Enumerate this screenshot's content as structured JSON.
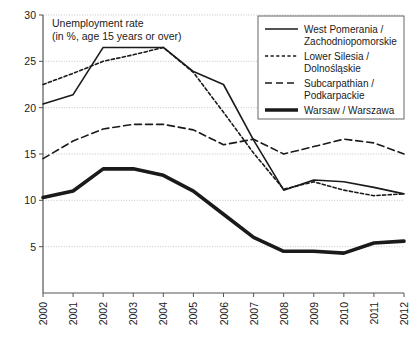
{
  "chart_data": {
    "type": "line",
    "title": "Unemployment rate",
    "subtitle": "(in %, age 15 years or over)",
    "xlabel": "",
    "ylabel": "",
    "x": [
      "2000",
      "2001",
      "2002",
      "2003",
      "2004",
      "2005",
      "2006",
      "2007",
      "2008",
      "2009",
      "2010",
      "2011",
      "2012"
    ],
    "categories": [
      "2000",
      "2001",
      "2002",
      "2003",
      "2004",
      "2005",
      "2006",
      "2007",
      "2008",
      "2009",
      "2010",
      "2011",
      "2012"
    ],
    "ylim": [
      0,
      30
    ],
    "yticks": [
      5,
      10,
      15,
      20,
      25,
      30
    ],
    "grid": true,
    "legend_position": "top-right",
    "series": [
      {
        "name": "West Pomerania / Zachodniopomorskie",
        "style": "solid-thin",
        "values": [
          20.4,
          21.4,
          26.5,
          26.5,
          26.5,
          23.9,
          22.5,
          16.5,
          11.1,
          12.2,
          12.0,
          11.4,
          10.7
        ]
      },
      {
        "name": "Lower Silesia / Dolnośląskie",
        "style": "dotted",
        "values": [
          22.5,
          23.7,
          25.0,
          25.7,
          26.5,
          23.8,
          19.5,
          15.1,
          11.2,
          12.0,
          11.1,
          10.5,
          10.7
        ]
      },
      {
        "name": "Subcarpathian / Podkarpackie",
        "style": "dashed",
        "values": [
          14.5,
          16.4,
          17.7,
          18.2,
          18.2,
          17.6,
          16.0,
          16.6,
          15.0,
          15.8,
          16.6,
          16.2,
          15.0
        ]
      },
      {
        "name": "Warsaw / Warszawa",
        "style": "solid-thick",
        "values": [
          10.3,
          11.0,
          13.4,
          13.4,
          12.7,
          11.0,
          8.5,
          6.0,
          4.5,
          4.5,
          4.3,
          5.4,
          5.6
        ]
      }
    ]
  },
  "legend": {
    "items": [
      {
        "label_line1": "West Pomerania /",
        "label_line2": "Zachodniopomorskie",
        "style": "solid-thin"
      },
      {
        "label_line1": "Lower Silesia /",
        "label_line2": "Dolnośląskie",
        "style": "dotted"
      },
      {
        "label_line1": "Subcarpathian /",
        "label_line2": "Podkarpackie",
        "style": "dashed"
      },
      {
        "label_line1": "Warsaw / Warszawa",
        "label_line2": "",
        "style": "solid-thick"
      }
    ]
  },
  "colors": {
    "line": "#1a1a1a",
    "grid": "#b8b8b8",
    "axis": "#555555",
    "background": "#ffffff"
  }
}
